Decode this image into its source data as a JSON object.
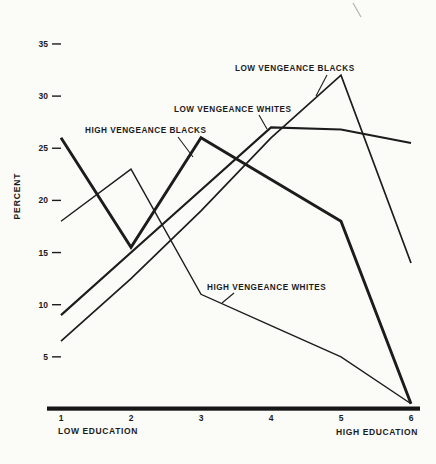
{
  "figure": {
    "background": "#fbfbf8",
    "ink_color": "#1c1c1c"
  },
  "chart_data": {
    "type": "line",
    "x": [
      1,
      2,
      3,
      4,
      5,
      6
    ],
    "x_tick_labels": [
      "1",
      "2",
      "3",
      "4",
      "5",
      "6"
    ],
    "y_ticks": [
      5,
      10,
      15,
      20,
      25,
      30,
      35
    ],
    "ylim": [
      0,
      37
    ],
    "grid": "off",
    "legend": "inline-annotations",
    "ylabel": "PERCENT",
    "xlabel_left": "LOW EDUCATION",
    "xlabel_right": "HIGH EDUCATION",
    "series": [
      {
        "name": "HIGH VENGEANCE BLACKS",
        "thickness": "thick",
        "values": [
          26,
          15.5,
          26,
          22,
          18,
          0.5
        ]
      },
      {
        "name": "HIGH VENGEANCE WHITES",
        "thickness": "hairline",
        "values": [
          18,
          23,
          11,
          8,
          5,
          0.5
        ]
      },
      {
        "name": "LOW VENGEANCE WHITES",
        "thickness": "medium",
        "values": [
          9,
          15,
          21,
          27,
          26.8,
          25.5
        ]
      },
      {
        "name": "LOW VENGEANCE BLACKS",
        "thickness": "thin",
        "values": [
          6.5,
          12.5,
          19,
          26,
          32,
          14
        ]
      }
    ],
    "annotations": [
      {
        "text": "HIGH VENGEANCE BLACKS",
        "points_to": "HIGH VENGEANCE BLACKS"
      },
      {
        "text": "LOW VENGEANCE WHITES",
        "points_to": "LOW VENGEANCE WHITES"
      },
      {
        "text": "LOW VENGEANCE BLACKS",
        "points_to": "LOW VENGEANCE BLACKS"
      },
      {
        "text": "HIGH VENGEANCE WHITES",
        "points_to": "HIGH VENGEANCE WHITES"
      }
    ]
  }
}
